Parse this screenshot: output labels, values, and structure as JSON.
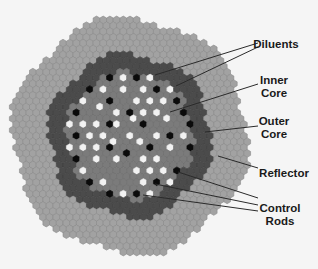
{
  "colors": {
    "background": "#f5f5f5",
    "reflector": "#a2a2a2",
    "reflector_edge": "#8a8a8a",
    "outer_core": "#4b4b4b",
    "outer_core_edge": "#404040",
    "inner_core": "#7b7b7b",
    "inner_core_edge": "#6c6c6c",
    "diluent": "#f2f2f2",
    "control_rod": "#0b0b0b",
    "leader_line": "#2a2a2a"
  },
  "geometry": {
    "center": [
      130,
      136
    ],
    "hex_pitch": 6.7,
    "reflector_radius": 118,
    "outer_core_radius": 82,
    "inner_core_radius": 64
  },
  "diluents": [
    [
      123,
      77
    ],
    [
      150,
      77
    ],
    [
      103,
      87
    ],
    [
      123,
      92
    ],
    [
      143,
      87
    ],
    [
      170,
      88
    ],
    [
      83,
      99
    ],
    [
      137,
      100
    ],
    [
      149,
      99
    ],
    [
      163,
      101
    ],
    [
      97,
      107
    ],
    [
      117,
      111
    ],
    [
      143,
      112
    ],
    [
      157,
      112
    ],
    [
      183,
      113
    ],
    [
      70,
      123
    ],
    [
      83,
      123
    ],
    [
      97,
      123
    ],
    [
      130,
      119
    ],
    [
      170,
      120
    ],
    [
      117,
      127
    ],
    [
      143,
      127
    ],
    [
      90,
      134
    ],
    [
      103,
      134
    ],
    [
      130,
      135
    ],
    [
      156,
      135
    ],
    [
      183,
      136
    ],
    [
      70,
      146
    ],
    [
      83,
      146
    ],
    [
      97,
      146
    ],
    [
      116,
      143
    ],
    [
      143,
      143
    ],
    [
      170,
      147
    ],
    [
      97,
      162
    ],
    [
      117,
      157
    ],
    [
      143,
      157
    ],
    [
      157,
      158
    ],
    [
      83,
      169
    ],
    [
      136,
      170
    ],
    [
      150,
      170
    ],
    [
      163,
      170
    ],
    [
      103,
      183
    ],
    [
      143,
      183
    ],
    [
      170,
      183
    ],
    [
      123,
      193
    ],
    [
      149,
      193
    ]
  ],
  "control_rods": [
    [
      110,
      76
    ],
    [
      137,
      77
    ],
    [
      89,
      87
    ],
    [
      157,
      87
    ],
    [
      110,
      99
    ],
    [
      177,
      99
    ],
    [
      77,
      110
    ],
    [
      130,
      111
    ],
    [
      183,
      110
    ],
    [
      110,
      123
    ],
    [
      143,
      123
    ],
    [
      190,
      124
    ],
    [
      77,
      134
    ],
    [
      170,
      135
    ],
    [
      110,
      146
    ],
    [
      149,
      146
    ],
    [
      190,
      147
    ],
    [
      77,
      157
    ],
    [
      129,
      151
    ],
    [
      177,
      171
    ],
    [
      90,
      181
    ],
    [
      156,
      183
    ],
    [
      110,
      193
    ],
    [
      136,
      193
    ]
  ],
  "labels": [
    {
      "id": "diluents",
      "lines": [
        "Diluents"
      ],
      "x": 276,
      "y": 38
    },
    {
      "id": "inner-core",
      "lines": [
        "Inner",
        "Core"
      ],
      "x": 274,
      "y": 74
    },
    {
      "id": "outer-core",
      "lines": [
        "Outer",
        "Core"
      ],
      "x": 274,
      "y": 115
    },
    {
      "id": "reflector",
      "lines": [
        "Reflector"
      ],
      "x": 284,
      "y": 167
    },
    {
      "id": "control-rods",
      "lines": [
        "Control",
        "Rods"
      ],
      "x": 280,
      "y": 202
    }
  ],
  "leader_lines": [
    {
      "label": "diluents",
      "from": [
        258,
        43
      ],
      "to": [
        155,
        75
      ]
    },
    {
      "label": "diluents",
      "from": [
        258,
        47
      ],
      "to": [
        176,
        86
      ]
    },
    {
      "label": "inner-core",
      "from": [
        258,
        84
      ],
      "to": [
        170,
        112
      ]
    },
    {
      "label": "outer-core",
      "from": [
        258,
        126
      ],
      "to": [
        205,
        132
      ]
    },
    {
      "label": "reflector",
      "from": [
        258,
        168
      ],
      "to": [
        218,
        156
      ]
    },
    {
      "label": "control-rods",
      "from": [
        258,
        198
      ],
      "to": [
        178,
        172
      ]
    },
    {
      "label": "control-rods",
      "from": [
        258,
        205
      ],
      "to": [
        155,
        184
      ]
    },
    {
      "label": "control-rods",
      "from": [
        258,
        211
      ],
      "to": [
        143,
        195
      ]
    }
  ]
}
